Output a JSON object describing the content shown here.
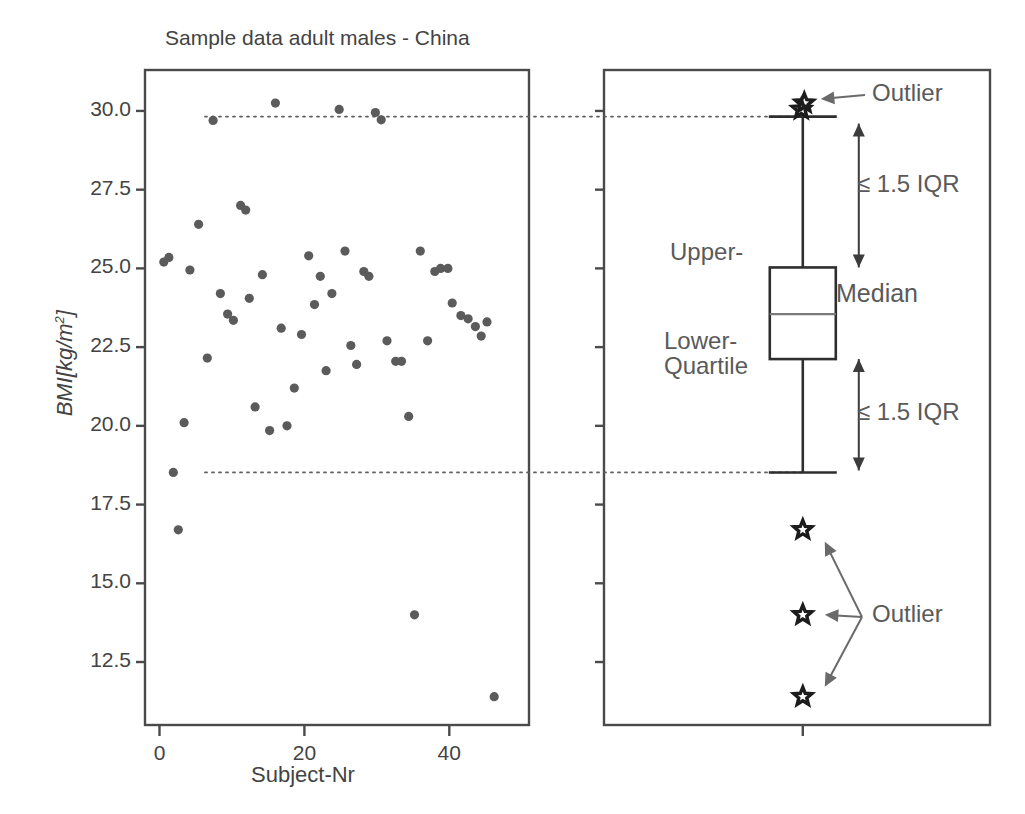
{
  "figure": {
    "title": "Sample data adult males - China",
    "panels": [
      "scatter",
      "boxplot"
    ]
  },
  "chart_data": [
    {
      "type": "scatter",
      "title": "Sample data adult males - China",
      "xlabel": "Subject-Nr",
      "ylabel": "BMI[kg/m2]",
      "ylabel_parts": {
        "italic_prefix": "BMI",
        "bracket_open": "[",
        "unit_num": "kg/m",
        "unit_exp": "2",
        "bracket_close": "]"
      },
      "xlim": [
        -2,
        51
      ],
      "ylim": [
        10.5,
        31.3
      ],
      "xticks": [
        0,
        20,
        40
      ],
      "xticklabels": [
        "0",
        "20",
        "40"
      ],
      "yticks": [
        12.5,
        15.0,
        17.5,
        20.0,
        22.5,
        25.0,
        27.5,
        30.0
      ],
      "yticklabels": [
        "12.5",
        "15.0",
        "17.5",
        "20.0",
        "22.5",
        "25.0",
        "27.5",
        "30.0"
      ],
      "grid": false,
      "legend": "none",
      "marker": "filled-circle",
      "marker_color": "#5b5b5b",
      "reference_lines": [
        {
          "name": "upper-whisker-reference",
          "y": 29.82,
          "style": "dotted"
        },
        {
          "name": "lower-whisker-reference",
          "y": 18.52,
          "style": "dotted"
        }
      ],
      "points": [
        {
          "x": 0.6,
          "y": 25.2
        },
        {
          "x": 1.3,
          "y": 25.35
        },
        {
          "x": 1.9,
          "y": 18.52
        },
        {
          "x": 2.6,
          "y": 16.7
        },
        {
          "x": 3.4,
          "y": 20.1
        },
        {
          "x": 4.2,
          "y": 24.95
        },
        {
          "x": 5.4,
          "y": 26.4
        },
        {
          "x": 6.6,
          "y": 22.15
        },
        {
          "x": 7.4,
          "y": 29.7
        },
        {
          "x": 8.4,
          "y": 24.2
        },
        {
          "x": 9.4,
          "y": 23.55
        },
        {
          "x": 10.2,
          "y": 23.35
        },
        {
          "x": 11.2,
          "y": 27.0
        },
        {
          "x": 11.9,
          "y": 26.85
        },
        {
          "x": 12.4,
          "y": 24.05
        },
        {
          "x": 13.2,
          "y": 20.6
        },
        {
          "x": 14.2,
          "y": 24.8
        },
        {
          "x": 15.2,
          "y": 19.85
        },
        {
          "x": 16.0,
          "y": 30.25
        },
        {
          "x": 16.8,
          "y": 23.1
        },
        {
          "x": 17.6,
          "y": 20.0
        },
        {
          "x": 18.6,
          "y": 21.2
        },
        {
          "x": 19.6,
          "y": 22.9
        },
        {
          "x": 20.6,
          "y": 25.4
        },
        {
          "x": 21.4,
          "y": 23.85
        },
        {
          "x": 22.2,
          "y": 24.75
        },
        {
          "x": 23.0,
          "y": 21.75
        },
        {
          "x": 23.8,
          "y": 24.2
        },
        {
          "x": 24.8,
          "y": 30.05
        },
        {
          "x": 25.6,
          "y": 25.55
        },
        {
          "x": 26.4,
          "y": 22.55
        },
        {
          "x": 27.2,
          "y": 21.95
        },
        {
          "x": 28.2,
          "y": 24.9
        },
        {
          "x": 28.9,
          "y": 24.75
        },
        {
          "x": 29.8,
          "y": 29.95
        },
        {
          "x": 30.6,
          "y": 29.72
        },
        {
          "x": 31.4,
          "y": 22.7
        },
        {
          "x": 32.6,
          "y": 22.05
        },
        {
          "x": 33.4,
          "y": 22.05
        },
        {
          "x": 34.4,
          "y": 20.3
        },
        {
          "x": 35.2,
          "y": 14.0
        },
        {
          "x": 36.0,
          "y": 25.55
        },
        {
          "x": 37.0,
          "y": 22.7
        },
        {
          "x": 38.0,
          "y": 24.9
        },
        {
          "x": 38.8,
          "y": 25.0
        },
        {
          "x": 39.8,
          "y": 25.0
        },
        {
          "x": 40.4,
          "y": 23.9
        },
        {
          "x": 41.6,
          "y": 23.5
        },
        {
          "x": 42.6,
          "y": 23.4
        },
        {
          "x": 43.6,
          "y": 23.15
        },
        {
          "x": 44.4,
          "y": 22.85
        },
        {
          "x": 45.2,
          "y": 23.3
        },
        {
          "x": 46.2,
          "y": 11.4
        }
      ]
    },
    {
      "type": "boxplot",
      "title": "",
      "ylim": [
        10.5,
        31.3
      ],
      "yticks": [
        12.5,
        15.0,
        17.5,
        20.0,
        22.5,
        25.0,
        27.5,
        30.0
      ],
      "grid": false,
      "legend": "none",
      "box": {
        "upper_whisker": 29.82,
        "upper_quartile": 25.03,
        "median": 23.55,
        "lower_quartile": 22.12,
        "lower_whisker": 18.52
      },
      "outliers_above": [
        30.05,
        30.25
      ],
      "outliers_below": [
        16.7,
        14.0,
        11.4
      ],
      "annotations": {
        "outlier_top": "Outlier",
        "outlier_bottom": "Outlier",
        "iqr_upper": "≤ 1.5 IQR",
        "iqr_lower": "≤ 1.5 IQR",
        "upper_quartile": "Upper-",
        "median": "Median",
        "lower_quartile_line1": "Lower-",
        "lower_quartile_line2": "Quartile"
      },
      "outlier_marker": "open-star"
    }
  ],
  "colors": {
    "frame": "#4a4a4a",
    "marker": "#5b5b5b",
    "box_stroke": "#2e2e2e",
    "median": "#7a7a7a",
    "annotation_text": "#5a5a5a",
    "tick_text": "#434343",
    "dotted_reference": "#5e5e5e",
    "star": "#1c1c1c",
    "background": "#ffffff"
  }
}
